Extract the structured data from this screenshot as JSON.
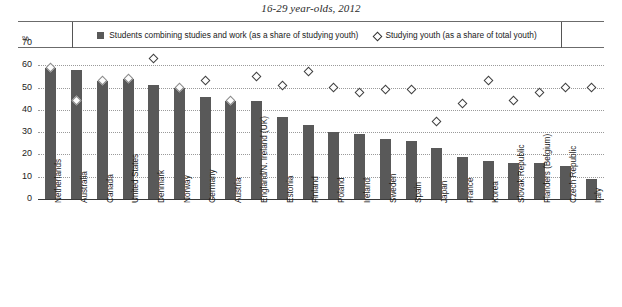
{
  "title": "16-29 year-olds, 2012",
  "axis": {
    "unit_label": "%",
    "yticks": [
      "70",
      "60",
      "50",
      "40",
      "30",
      "20",
      "10",
      "0"
    ],
    "ymin": 0,
    "ymax": 70
  },
  "legend": {
    "items": [
      {
        "icon": "filled-square",
        "label": "Students combining studies and work (as a share of studying youth)"
      },
      {
        "icon": "open-diamond",
        "label": "Studying youth (as a share of total youth)"
      }
    ]
  },
  "chart_data": {
    "type": "bar",
    "title": "16-29 year-olds, 2012",
    "xlabel": "",
    "ylabel": "%",
    "ylim": [
      0,
      70
    ],
    "grid": true,
    "legend_position": "top",
    "categories": [
      "Netherlands",
      "Australia",
      "Canada",
      "United States",
      "Denmark",
      "Norway",
      "Germany",
      "Austria",
      "England/N. Ireland (UK)",
      "Estonia",
      "Finland",
      "Poland",
      "Ireland",
      "Sweden",
      "Spain",
      "Japan",
      "France",
      "Korea",
      "Slovak Republic",
      "Flanders (Belgium)",
      "Czech Republic",
      "Italy"
    ],
    "series": [
      {
        "name": "Students combining studies and work (as a share of studying youth)",
        "type": "bar",
        "values": [
          59,
          58,
          53,
          54,
          51,
          50,
          46,
          44,
          44,
          37,
          33,
          30,
          29,
          27,
          26,
          23,
          19,
          17,
          16,
          16,
          15,
          9
        ]
      },
      {
        "name": "Studying youth (as a share of total youth)",
        "type": "scatter",
        "marker": "open-diamond",
        "values": [
          59,
          44,
          53,
          54,
          63,
          50,
          53,
          44,
          55,
          51,
          57,
          50,
          48,
          49,
          49,
          35,
          43,
          53,
          44,
          48,
          50,
          50
        ]
      }
    ]
  }
}
